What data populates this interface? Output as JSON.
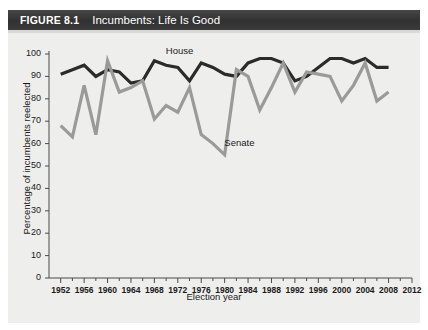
{
  "figure": {
    "number_label": "FIGURE 8.1",
    "title": "Incumbents: Life Is Good",
    "band_color": "#3a3a3a",
    "panel_color": "#eeeeec"
  },
  "chart_data": {
    "type": "line",
    "title": "Incumbents: Life Is Good",
    "xlabel": "Election year",
    "ylabel": "Percentage of incumbents reelected",
    "xlim": [
      1950,
      2012
    ],
    "ylim": [
      0,
      100
    ],
    "ytick_labels": [
      "0",
      "10",
      "20",
      "30",
      "40",
      "50",
      "60",
      "70",
      "80",
      "90",
      "100"
    ],
    "ytick_values": [
      0,
      10,
      20,
      30,
      40,
      50,
      60,
      70,
      80,
      90,
      100
    ],
    "xtick_labels": [
      "1952",
      "1956",
      "1960",
      "1964",
      "1968",
      "1972",
      "1976",
      "1980",
      "1984",
      "1988",
      "1992",
      "1996",
      "2000",
      "2004",
      "2008",
      "2012"
    ],
    "xtick_values": [
      1952,
      1956,
      1960,
      1964,
      1968,
      1972,
      1976,
      1980,
      1984,
      1988,
      1992,
      1996,
      2000,
      2004,
      2008,
      2012
    ],
    "minor_tick_interval": 2,
    "grid": false,
    "legend_position": "inline-annotations",
    "x": [
      1952,
      1954,
      1956,
      1958,
      1960,
      1962,
      1964,
      1966,
      1968,
      1970,
      1972,
      1974,
      1976,
      1978,
      1980,
      1982,
      1984,
      1986,
      1988,
      1990,
      1992,
      1994,
      1996,
      1998,
      2000,
      2002,
      2004,
      2006,
      2008
    ],
    "series": [
      {
        "name": "House",
        "color": "#2b2b2b",
        "label_text": "House",
        "values": [
          91,
          93,
          95,
          90,
          93,
          92,
          87,
          88,
          97,
          95,
          94,
          88,
          96,
          94,
          91,
          90,
          96,
          98,
          98,
          96,
          88,
          90,
          94,
          98,
          98,
          96,
          98,
          94,
          94
        ]
      },
      {
        "name": "Senate",
        "color": "#9a9a9a",
        "label_text": "Senate",
        "values": [
          68,
          63,
          86,
          64,
          97,
          83,
          85,
          88,
          71,
          77,
          74,
          85,
          64,
          60,
          55,
          93,
          90,
          75,
          85,
          96,
          83,
          92,
          91,
          90,
          79,
          86,
          96,
          79,
          83
        ]
      }
    ],
    "annotations": [
      {
        "text": "House",
        "x": 1972,
        "y": 101
      },
      {
        "text": "Senate",
        "x": 1982,
        "y": 60
      }
    ]
  }
}
